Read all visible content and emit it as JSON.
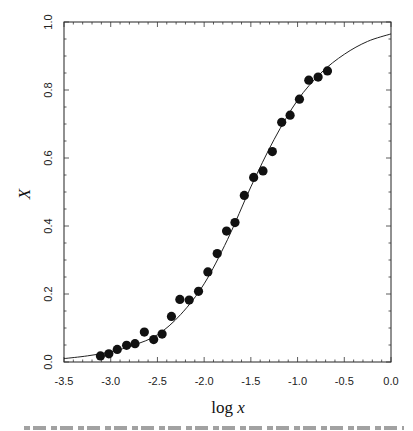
{
  "chart_data": {
    "type": "scatter",
    "title": "",
    "xlabel": "log x",
    "ylabel": "X",
    "xlim": [
      -3.5,
      0.0
    ],
    "ylim": [
      0.0,
      1.0
    ],
    "grid": false,
    "legend": null,
    "x_ticks": [
      "-3.5",
      "-3.0",
      "-2.5",
      "-2.0",
      "-1.5",
      "-1.0",
      "-0.5",
      "0.0"
    ],
    "y_ticks": [
      "0.0",
      "0.2",
      "0.4",
      "0.6",
      "0.8",
      "1.0"
    ],
    "series": [
      {
        "name": "data points",
        "style": "filled-circle",
        "x": [
          -3.11,
          -3.02,
          -2.93,
          -2.83,
          -2.74,
          -2.64,
          -2.54,
          -2.45,
          -2.35,
          -2.26,
          -2.16,
          -2.06,
          -1.96,
          -1.86,
          -1.76,
          -1.67,
          -1.57,
          -1.47,
          -1.37,
          -1.27,
          -1.17,
          -1.08,
          -0.98,
          -0.88,
          -0.78,
          -0.68
        ],
        "y": [
          0.018,
          0.024,
          0.037,
          0.049,
          0.054,
          0.088,
          0.066,
          0.082,
          0.134,
          0.184,
          0.182,
          0.208,
          0.265,
          0.319,
          0.385,
          0.41,
          0.49,
          0.543,
          0.562,
          0.619,
          0.705,
          0.726,
          0.773,
          0.829,
          0.838,
          0.856
        ]
      },
      {
        "name": "fitted curve",
        "style": "line",
        "x": [
          -3.5,
          -3.25,
          -3.0,
          -2.75,
          -2.5,
          -2.25,
          -2.0,
          -1.75,
          -1.5,
          -1.25,
          -1.0,
          -0.75,
          -0.5,
          -0.25,
          0.0
        ],
        "y": [
          0.01,
          0.018,
          0.03,
          0.05,
          0.08,
          0.14,
          0.23,
          0.36,
          0.515,
          0.655,
          0.77,
          0.85,
          0.905,
          0.943,
          0.965
        ]
      }
    ]
  },
  "caption": {
    "visible": "partially cropped, illegible"
  }
}
